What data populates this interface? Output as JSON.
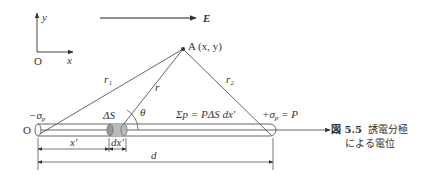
{
  "figure": {
    "number": "図 5.5",
    "caption_line1": "誘電分極",
    "caption_line2": "による電位"
  },
  "axes_inset": {
    "y_label": "y",
    "x_label": "x",
    "origin": "O"
  },
  "field": {
    "label": "E"
  },
  "point": {
    "label": "A (x, y)"
  },
  "distances": {
    "r1": "r₁",
    "r": "r",
    "r2": "r₂"
  },
  "angle": {
    "label": "θ"
  },
  "rod": {
    "left_charge": "−σ",
    "left_charge_sub": "p",
    "right_charge_prefix": "+σ",
    "right_charge_sub": "p",
    "right_charge_suffix": " = P",
    "origin": "O",
    "axis": "x",
    "element": "ΔS",
    "sum_text": "Σp = PΔS dx′"
  },
  "dimensions": {
    "x_prime": "x′",
    "dx_prime": "dx′",
    "d": "d"
  }
}
